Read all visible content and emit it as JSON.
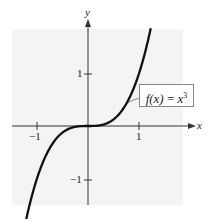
{
  "chart_data": {
    "type": "line",
    "title": "",
    "function_label": "f(x) = x^3",
    "function_label_parts": {
      "lhs": "f(x)",
      "eq": "=",
      "base": "x",
      "exp": "3"
    },
    "xlabel": "x",
    "ylabel": "y",
    "xlim": [
      -1.5,
      1.9
    ],
    "ylim": [
      -1.5,
      1.9
    ],
    "x_ticks": [
      {
        "value": -1,
        "label": "−1"
      },
      {
        "value": 1,
        "label": "1"
      }
    ],
    "y_ticks": [
      {
        "value": 1,
        "label": "1"
      },
      {
        "value": -1,
        "label": "−1"
      }
    ],
    "series": [
      {
        "name": "f(x) = x^3",
        "x": [
          -1.22,
          -1.0,
          -0.75,
          -0.5,
          -0.25,
          0,
          0.25,
          0.5,
          0.75,
          1.0,
          1.23
        ],
        "y": [
          -1.82,
          -1.0,
          -0.42,
          -0.125,
          -0.016,
          0,
          0.016,
          0.125,
          0.42,
          1.0,
          1.86
        ]
      }
    ],
    "grid": false,
    "background": "#f4f4f4",
    "curve_color": "#111111"
  }
}
